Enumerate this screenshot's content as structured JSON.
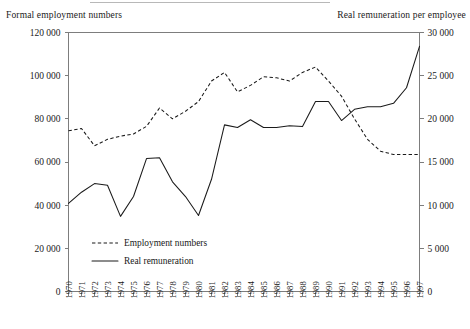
{
  "captions": {
    "left_axis_title": "Formal employment numbers",
    "right_axis_title": "Real remuneration per employee"
  },
  "legend": {
    "position": "inside-lower-left",
    "entries": [
      {
        "label": "Employment numbers",
        "style": "dashed",
        "color": "#1a1a1a"
      },
      {
        "label": "Real remuneration",
        "style": "solid",
        "color": "#1a1a1a"
      }
    ]
  },
  "axes": {
    "left": {
      "title": "Formal employment numbers",
      "min": 0,
      "max": 120000,
      "tick_labels": [
        "0",
        "20 000",
        "40 000",
        "60 000",
        "80 000",
        "100 000",
        "120 000"
      ],
      "tick_values": [
        0,
        20000,
        40000,
        60000,
        80000,
        100000,
        120000
      ]
    },
    "right": {
      "title": "Real remuneration per employee",
      "min": 0,
      "max": 30000,
      "tick_labels": [
        "0",
        "5 000",
        "10 000",
        "15 000",
        "20 000",
        "25 000",
        "30 000"
      ],
      "tick_values": [
        0,
        5000,
        10000,
        15000,
        20000,
        25000,
        30000
      ]
    },
    "x": {
      "tick_labels": [
        "1970",
        "1971",
        "1972",
        "1973",
        "1974",
        "1975",
        "1976",
        "1977",
        "1978",
        "1979",
        "1980",
        "1981",
        "1982",
        "1983",
        "1984",
        "1985",
        "1986",
        "1987",
        "1988",
        "1989",
        "1990",
        "1991",
        "1992",
        "1993",
        "1994",
        "1995",
        "1996",
        "1997"
      ],
      "label_rotation": -90
    }
  },
  "chart_data": {
    "type": "line",
    "title": "",
    "subtitle": "",
    "xlabel": "",
    "ylabel": "Formal employment numbers",
    "y2label": "Real remuneration per employee",
    "grid": false,
    "legend_position": "inside-lower-left",
    "x": [
      1970,
      1971,
      1972,
      1973,
      1974,
      1975,
      1976,
      1977,
      1978,
      1979,
      1980,
      1981,
      1982,
      1983,
      1984,
      1985,
      1986,
      1987,
      1988,
      1989,
      1990,
      1991,
      1992,
      1993,
      1994,
      1995,
      1996,
      1997
    ],
    "xlim": [
      1970,
      1997
    ],
    "ylim": [
      0,
      120000
    ],
    "y2lim": [
      0,
      30000
    ],
    "series": [
      {
        "name": "Employment numbers",
        "axis": "left",
        "style": "dashed",
        "units": "persons",
        "values": [
          74500,
          75500,
          67500,
          70500,
          72000,
          73000,
          76500,
          85000,
          80000,
          83500,
          88000,
          97500,
          101500,
          92500,
          95500,
          99500,
          99000,
          97500,
          101500,
          104000,
          97500,
          90500,
          80000,
          70500,
          65000,
          63500,
          63500,
          63500
        ]
      },
      {
        "name": "Real remuneration",
        "axis": "right",
        "style": "solid",
        "units": "currency per employee",
        "values": [
          10200,
          11500,
          12500,
          12300,
          8700,
          11000,
          15400,
          15500,
          12700,
          11000,
          8800,
          13000,
          19300,
          19000,
          19900,
          19000,
          19000,
          19200,
          19100,
          22000,
          22000,
          19800,
          21100,
          21400,
          21400,
          21800,
          23600,
          28400
        ]
      }
    ]
  }
}
